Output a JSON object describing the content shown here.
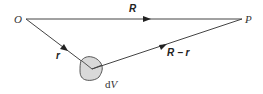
{
  "diagram": {
    "points": {
      "origin": {
        "label": "O"
      },
      "field_point": {
        "label": "P"
      }
    },
    "vectors": {
      "R": {
        "label": "R"
      },
      "r": {
        "label": "r"
      },
      "R_minus_r": {
        "label": "R − r"
      }
    },
    "volume_element": {
      "label_d": "d",
      "label_V": "V",
      "fill": "#d9d9d9"
    },
    "colors": {
      "line": "#333333",
      "text": "#333333"
    }
  }
}
